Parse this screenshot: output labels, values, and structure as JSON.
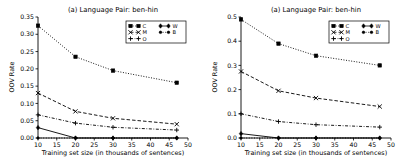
{
  "figure": {
    "background": "#ffffff",
    "foreground": "#000000",
    "panel_count": 2
  },
  "chart_data": [
    {
      "type": "line",
      "panel": "left",
      "title": "(a) Language Pair: ben-hin",
      "xlabel": "Training set size (in thousands of sentences)",
      "ylabel": "OOV Rate",
      "x": [
        10,
        20,
        30,
        47
      ],
      "xlim": [
        10,
        50
      ],
      "ylim": [
        0.0,
        0.35
      ],
      "xticks": [
        10,
        15,
        20,
        25,
        30,
        35,
        40,
        45,
        50
      ],
      "xticklabels": [
        "10",
        "15",
        "20",
        "25",
        "30",
        "35",
        "40",
        "45",
        "50"
      ],
      "yticks": [
        0.0,
        0.05,
        0.1,
        0.15,
        0.2,
        0.25,
        0.3,
        0.35
      ],
      "yticklabels": [
        "0.00",
        "0.05",
        "0.10",
        "0.15",
        "0.20",
        "0.25",
        "0.30",
        "0.35"
      ],
      "grid": false,
      "legend_position": "upper right",
      "legend_columns": 2,
      "series": [
        {
          "name": "C",
          "marker": "square",
          "linestyle": "dotted",
          "values": [
            0.325,
            0.235,
            0.195,
            0.16
          ]
        },
        {
          "name": "M",
          "marker": "x",
          "linestyle": "dashed",
          "values": [
            0.13,
            0.077,
            0.057,
            0.04
          ]
        },
        {
          "name": "O",
          "marker": "plus",
          "linestyle": "dashdot",
          "values": [
            0.067,
            0.043,
            0.031,
            0.023
          ]
        },
        {
          "name": "W",
          "marker": "diamond",
          "linestyle": "solid",
          "values": [
            0.03,
            0.0,
            0.0,
            0.0
          ]
        },
        {
          "name": "B",
          "marker": "dot",
          "linestyle": "dotted",
          "values": [
            0.0,
            0.0,
            0.0,
            0.0
          ]
        }
      ]
    },
    {
      "type": "line",
      "panel": "right",
      "title": "(a) Language Pair: ben-hin",
      "xlabel": "Training set size (in thousands of sentences)",
      "ylabel": "OOV Rate",
      "x": [
        10,
        20,
        30,
        47
      ],
      "xlim": [
        10,
        50
      ],
      "ylim": [
        0.0,
        0.5
      ],
      "xticks": [
        10,
        15,
        20,
        25,
        30,
        35,
        40,
        45,
        50
      ],
      "xticklabels": [
        "10",
        "15",
        "20",
        "25",
        "30",
        "35",
        "40",
        "45",
        "50"
      ],
      "yticks": [
        0.0,
        0.1,
        0.2,
        0.3,
        0.4,
        0.5
      ],
      "yticklabels": [
        "0.0",
        "0.1",
        "0.2",
        "0.3",
        "0.4",
        "0.5"
      ],
      "grid": false,
      "legend_position": "upper right",
      "legend_columns": 2,
      "series": [
        {
          "name": "C",
          "marker": "square",
          "linestyle": "dotted",
          "values": [
            0.49,
            0.39,
            0.34,
            0.3
          ]
        },
        {
          "name": "M",
          "marker": "x",
          "linestyle": "dashed",
          "values": [
            0.275,
            0.195,
            0.165,
            0.13
          ]
        },
        {
          "name": "O",
          "marker": "plus",
          "linestyle": "dashdot",
          "values": [
            0.1,
            0.068,
            0.055,
            0.045
          ]
        },
        {
          "name": "W",
          "marker": "diamond",
          "linestyle": "solid",
          "values": [
            0.018,
            0.0,
            0.0,
            0.0
          ]
        },
        {
          "name": "B",
          "marker": "dot",
          "linestyle": "dotted",
          "values": [
            0.0,
            0.0,
            0.0,
            0.0
          ]
        }
      ]
    }
  ],
  "legend": {
    "entries": [
      {
        "label": "C",
        "column": 0,
        "row": 0
      },
      {
        "label": "W",
        "column": 1,
        "row": 0
      },
      {
        "label": "M",
        "column": 0,
        "row": 1
      },
      {
        "label": "B",
        "column": 1,
        "row": 1
      },
      {
        "label": "O",
        "column": 0,
        "row": 2
      }
    ]
  }
}
